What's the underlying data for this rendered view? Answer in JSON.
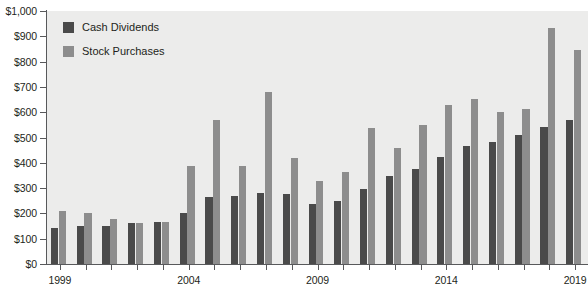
{
  "chart_data": {
    "type": "bar",
    "title": "",
    "subtitle": "",
    "xlabel": "",
    "ylabel": "",
    "ylim": [
      0,
      1000
    ],
    "ytick_step": 100,
    "ytick_labels": [
      "$0",
      "$100",
      "$200",
      "$300",
      "$400",
      "$500",
      "$600",
      "$700",
      "$800",
      "$900",
      "$1,000"
    ],
    "grid": false,
    "legend_position": "top-left",
    "categories": [
      "1999",
      "2000",
      "2001",
      "2002",
      "2003",
      "2004",
      "2005",
      "2006",
      "2007",
      "2008",
      "2009",
      "2010",
      "2011",
      "2012",
      "2013",
      "2014",
      "2015",
      "2016",
      "2017",
      "2018",
      "2019"
    ],
    "xtick_labels_shown": [
      "1999",
      "2004",
      "2009",
      "2014",
      "2019"
    ],
    "series": [
      {
        "name": "Cash Dividends",
        "color": "#4a4a4a",
        "values": [
          142,
          150,
          152,
          163,
          168,
          203,
          264,
          268,
          282,
          277,
          238,
          250,
          295,
          347,
          377,
          423,
          466,
          483,
          509,
          541,
          571
        ]
      },
      {
        "name": "Stock Purchases",
        "color": "#8d8d8d",
        "values": [
          211,
          200,
          176,
          163,
          168,
          389,
          571,
          389,
          680,
          420,
          328,
          364,
          539,
          458,
          550,
          629,
          651,
          601,
          613,
          932,
          846
        ]
      }
    ]
  },
  "legend": {
    "items": [
      {
        "label": "Cash Dividends",
        "swatch": "dividends"
      },
      {
        "label": "Stock Purchases",
        "swatch": "purchases"
      }
    ]
  },
  "colors": {
    "dividends": "#4a4a4a",
    "purchases": "#8d8d8d",
    "plot_background": "#ececeb",
    "axis": "#58595b",
    "text": "#231f20"
  }
}
